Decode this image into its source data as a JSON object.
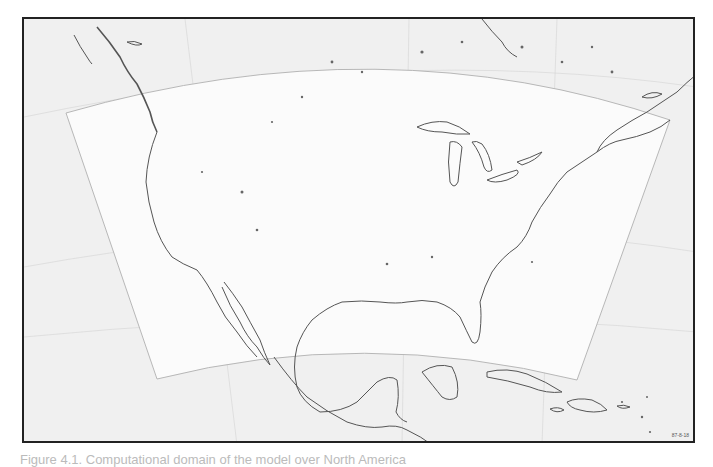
{
  "figure": {
    "map_id_label": "87-8-18",
    "caption": "Figure 4.1. Computational domain of the model over North America",
    "colors": {
      "frame_border": "#222222",
      "outside_domain": "#f0f0f0",
      "inside_domain": "#fbfbfb",
      "domain_outline": "#b0b0b0",
      "coastline": "#555555",
      "grid_lines": "#d0d0d0"
    },
    "domain_corners": {
      "top_left": [
        64,
        111
      ],
      "top_right": [
        668,
        118
      ],
      "bottom_right": [
        575,
        378
      ],
      "bottom_left": [
        155,
        377
      ]
    },
    "regions_shown": [
      "Canada",
      "United States",
      "Mexico",
      "Central America",
      "Caribbean",
      "Great Lakes",
      "Gulf of Mexico"
    ]
  }
}
